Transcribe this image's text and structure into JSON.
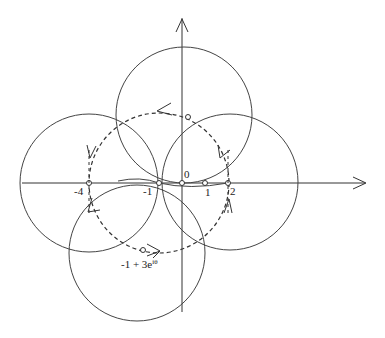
{
  "diagram": {
    "axes": {
      "real_axis": {
        "has_arrow": true
      },
      "imag_axis": {
        "has_arrow": true
      }
    },
    "tick_labels": {
      "minus_four": "-4",
      "minus_one": "-1",
      "zero": "0",
      "one": "1",
      "two": "2"
    },
    "annotation": {
      "base": "-1 + 3e",
      "superscript": "iθ"
    },
    "colors": {
      "stroke": "#333333",
      "background": "#ffffff"
    }
  }
}
